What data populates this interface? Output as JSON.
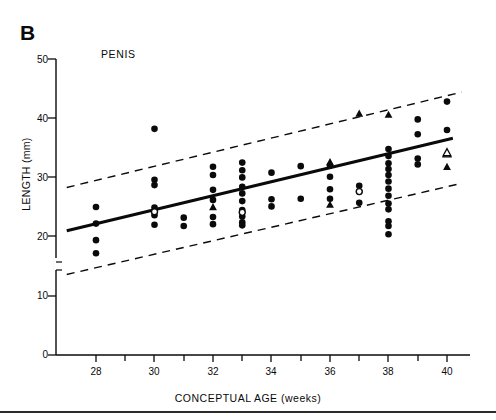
{
  "figure": {
    "panel_letter": "B",
    "title": "PENIS",
    "background_color": "#ffffff",
    "ink_color": "#0a0a0a"
  },
  "chart_data": {
    "type": "scatter",
    "title": "PENIS",
    "panel": "B",
    "xlabel": "CONCEPTUAL AGE (weeks)",
    "ylabel": "LENGTH (mm)",
    "xlim": [
      27,
      40.8
    ],
    "ylim": [
      0,
      50
    ],
    "xticks": [
      28,
      30,
      32,
      34,
      36,
      38,
      40
    ],
    "xminor_ticks": [
      29,
      31,
      33,
      35,
      37,
      39
    ],
    "yticks": [
      0,
      10,
      20,
      30,
      40,
      50
    ],
    "y_axis_break": {
      "between": [
        13,
        17
      ],
      "shown": true
    },
    "grid": false,
    "legend": false,
    "marker_types": [
      "filled-circle",
      "open-circle",
      "filled-triangle",
      "open-triangle"
    ],
    "series": [
      {
        "name": "filled-circle",
        "marker": "filled-circle",
        "points": [
          [
            28,
            25.0
          ],
          [
            28,
            22.2
          ],
          [
            28,
            19.4
          ],
          [
            28,
            17.2
          ],
          [
            30,
            38.2
          ],
          [
            30,
            29.6
          ],
          [
            30,
            28.7
          ],
          [
            30,
            24.9
          ],
          [
            30,
            23.6
          ],
          [
            30,
            22.0
          ],
          [
            31,
            23.2
          ],
          [
            31,
            21.8
          ],
          [
            32,
            31.8
          ],
          [
            32,
            30.4
          ],
          [
            32,
            27.9
          ],
          [
            32,
            26.2
          ],
          [
            32,
            23.3
          ],
          [
            32,
            22.1
          ],
          [
            33,
            32.5
          ],
          [
            33,
            31.2
          ],
          [
            33,
            30.0
          ],
          [
            33,
            28.4
          ],
          [
            33,
            27.3
          ],
          [
            33,
            26.0
          ],
          [
            33,
            24.5
          ],
          [
            33,
            23.4
          ],
          [
            33,
            22.4
          ],
          [
            33,
            21.9
          ],
          [
            34,
            30.8
          ],
          [
            34,
            26.3
          ],
          [
            34,
            25.1
          ],
          [
            35,
            31.9
          ],
          [
            35,
            26.4
          ],
          [
            36,
            32.0
          ],
          [
            36,
            30.1
          ],
          [
            36,
            28.0
          ],
          [
            36,
            26.4
          ],
          [
            37,
            28.6
          ],
          [
            37,
            27.6
          ],
          [
            37,
            25.7
          ],
          [
            38,
            34.8
          ],
          [
            38,
            33.6
          ],
          [
            38,
            32.4
          ],
          [
            38,
            31.4
          ],
          [
            38,
            30.4
          ],
          [
            38,
            29.3
          ],
          [
            38,
            28.1
          ],
          [
            38,
            26.9
          ],
          [
            38,
            25.6
          ],
          [
            38,
            24.6
          ],
          [
            38,
            22.6
          ],
          [
            38,
            21.8
          ],
          [
            38,
            20.4
          ],
          [
            39,
            39.8
          ],
          [
            39,
            37.3
          ],
          [
            39,
            33.2
          ],
          [
            39,
            32.2
          ],
          [
            40,
            42.8
          ],
          [
            40,
            38.0
          ]
        ]
      },
      {
        "name": "open-circle",
        "marker": "open-circle",
        "points": [
          [
            30,
            24.2
          ],
          [
            33,
            24.1
          ],
          [
            37,
            27.6
          ]
        ]
      },
      {
        "name": "filled-triangle",
        "marker": "filled-triangle",
        "points": [
          [
            32,
            25.0
          ],
          [
            36,
            25.4
          ],
          [
            36,
            32.6
          ],
          [
            37,
            40.8
          ],
          [
            38,
            40.6
          ],
          [
            40,
            31.8
          ]
        ]
      },
      {
        "name": "open-triangle",
        "marker": "open-triangle",
        "points": [
          [
            40,
            34.0
          ],
          [
            40,
            34.2
          ]
        ]
      }
    ],
    "regression_line": {
      "style": "solid",
      "x": [
        27.0,
        40.2
      ],
      "y": [
        21.0,
        36.6
      ],
      "label": "regression"
    },
    "confidence_bands": [
      {
        "style": "dashed",
        "name": "upper-band",
        "x": [
          27.0,
          40.5
        ],
        "y": [
          28.3,
          44.4
        ]
      },
      {
        "style": "dashed",
        "name": "lower-band",
        "x": [
          27.0,
          40.5
        ],
        "y": [
          13.6,
          29.0
        ]
      }
    ]
  },
  "axes": {
    "y_tick_labels": [
      "50",
      "40",
      "30",
      "20",
      "10",
      "0"
    ],
    "x_tick_labels": [
      "28",
      "30",
      "32",
      "34",
      "36",
      "38",
      "40"
    ]
  }
}
